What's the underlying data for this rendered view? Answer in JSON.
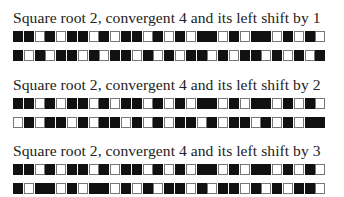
{
  "sections": [
    {
      "title": "Square root 2, convergent 4 and its left shift by 1",
      "shift": 1,
      "rows": [
        "BBWBWBBWBWBBWBWBWBBWBWBBWBWBW",
        "BWBWBBWBWBBWBWBWBBWBWBBWBWBWB"
      ]
    },
    {
      "title": "Square root 2, convergent 4 and its left shift by 2",
      "shift": 2,
      "rows": [
        "BBWBWBBWBWBBWBWBWBBWBWBBWBWBW",
        "WBWBBWBWBBWBWBWBBWBWBBWBWBWBB"
      ]
    },
    {
      "title": "Square root 2, convergent 4 and its left shift by 3",
      "shift": 3,
      "rows": [
        "BBWBWBBWBWBBWBWBWBBWBWBBWBWBW",
        "BWBBWBWBBWBWBWBBWBWBBWBWBWBBW"
      ]
    }
  ],
  "legend": {
    "B": "filled square",
    "W": "empty square"
  },
  "colors": {
    "filled": "#111111",
    "empty": "#ffffff",
    "border": "#777777"
  }
}
